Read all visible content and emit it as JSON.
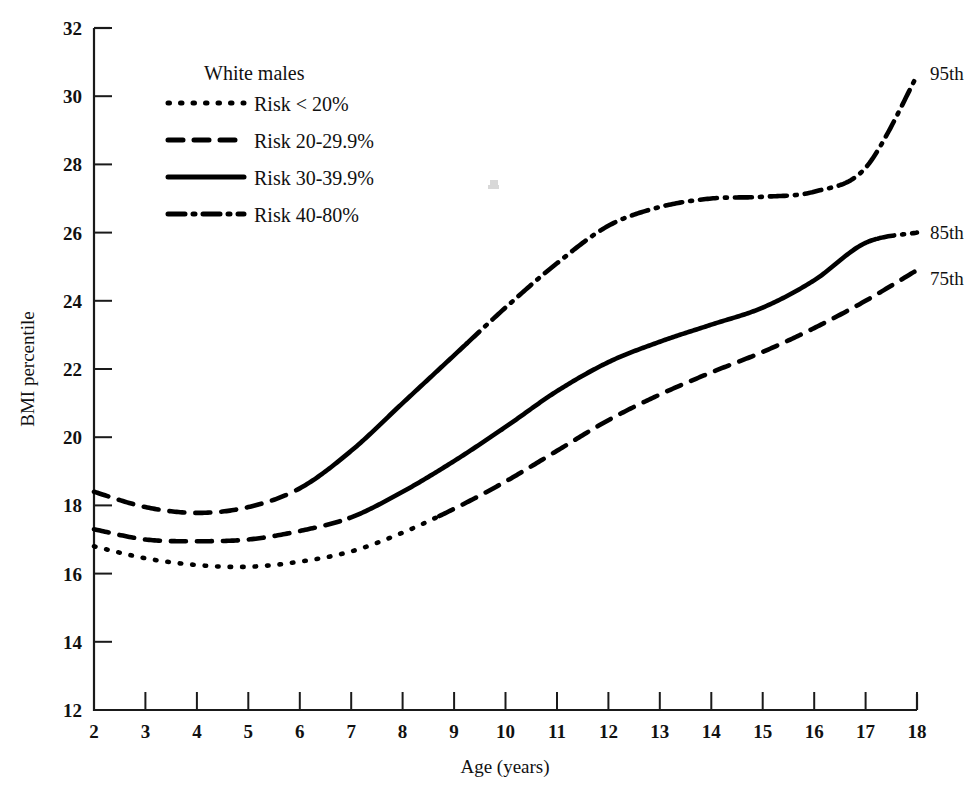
{
  "chart_data": {
    "type": "line",
    "title": "",
    "xlabel": "Age (years)",
    "ylabel": "BMI percentile",
    "xlim": [
      2,
      18
    ],
    "ylim": [
      12,
      32
    ],
    "xticks": [
      2,
      3,
      4,
      5,
      6,
      7,
      8,
      9,
      10,
      11,
      12,
      13,
      14,
      15,
      16,
      17,
      18
    ],
    "yticks": [
      12,
      14,
      16,
      18,
      20,
      22,
      24,
      26,
      28,
      30,
      32
    ],
    "grid": false,
    "legend_position": "upper-left-inside",
    "legend_title": "White males",
    "legend_entries": [
      {
        "label": "Risk < 20%",
        "style": "dotted"
      },
      {
        "label": "Risk 20-29.9%",
        "style": "dashed"
      },
      {
        "label": "Risk 30-39.9%",
        "style": "solid"
      },
      {
        "label": "Risk 40-80%",
        "style": "dashdot"
      }
    ],
    "x": [
      2,
      3,
      4,
      5,
      6,
      7,
      8,
      9,
      10,
      11,
      12,
      13,
      14,
      15,
      16,
      17,
      18
    ],
    "series": [
      {
        "name": "95th",
        "end_label": "95th",
        "values": [
          18.4,
          17.95,
          17.78,
          17.95,
          18.5,
          19.6,
          21.0,
          22.4,
          23.8,
          25.1,
          26.2,
          26.75,
          27.0,
          27.05,
          27.2,
          27.9,
          30.6
        ],
        "risk_segments": [
          {
            "style": "dashed",
            "x_start": 2,
            "x_end": 5.9
          },
          {
            "style": "solid",
            "x_start": 5.9,
            "x_end": 9.25
          },
          {
            "style": "dashdot",
            "x_start": 9.25,
            "x_end": 18
          }
        ]
      },
      {
        "name": "85th",
        "end_label": "85th",
        "values": [
          17.3,
          17.0,
          16.95,
          17.0,
          17.25,
          17.65,
          18.4,
          19.3,
          20.3,
          21.35,
          22.2,
          22.8,
          23.3,
          23.8,
          24.6,
          25.7,
          26.0
        ],
        "risk_segments": [
          {
            "style": "dashed",
            "x_start": 2,
            "x_end": 6.95
          },
          {
            "style": "solid",
            "x_start": 6.95,
            "x_end": 17.2
          },
          {
            "style": "dashdot",
            "x_start": 17.2,
            "x_end": 18
          }
        ]
      },
      {
        "name": "75th",
        "end_label": "75th",
        "values": [
          16.8,
          16.45,
          16.25,
          16.2,
          16.35,
          16.65,
          17.2,
          17.9,
          18.7,
          19.6,
          20.5,
          21.25,
          21.9,
          22.5,
          23.2,
          24.0,
          24.9
        ],
        "risk_segments": [
          {
            "style": "dotted",
            "x_start": 2,
            "x_end": 8.7
          },
          {
            "style": "dashed",
            "x_start": 8.7,
            "x_end": 18
          }
        ]
      }
    ]
  },
  "colors": {
    "ink": "#000000",
    "axis": "#1a1a1a",
    "background": "#ffffff"
  }
}
